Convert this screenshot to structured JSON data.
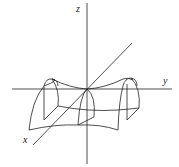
{
  "diagram": {
    "axes": {
      "x_label": "x",
      "y_label": "y",
      "z_label": "z"
    },
    "stroke_color": "#222222",
    "background": "#ffffff"
  }
}
